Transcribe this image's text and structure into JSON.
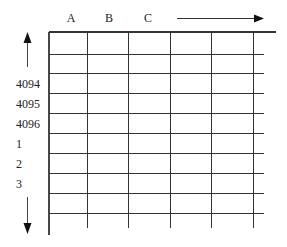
{
  "diagram": {
    "column_labels": [
      "A",
      "B",
      "C"
    ],
    "row_labels": [
      "4094",
      "4095",
      "4096",
      "1",
      "2",
      "3"
    ],
    "arrows": {
      "horizontal": "right-arrow",
      "vertical_top": "up-arrow",
      "vertical_bottom": "down-arrow"
    },
    "grid": {
      "columns": 6,
      "rows": 9,
      "line_color": "#333333"
    }
  }
}
